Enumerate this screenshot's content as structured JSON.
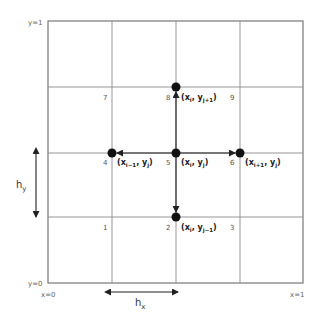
{
  "diagram": {
    "type": "finite-difference 5-point stencil on uniform grid",
    "boundary_labels": {
      "y_top": "y=1",
      "y_bottom": "y=0",
      "x_left": "x=0",
      "x_right": "x=1"
    },
    "spacing_labels": {
      "hy": {
        "base": "h",
        "sub": "y"
      },
      "hx": {
        "base": "h",
        "sub": "x"
      }
    },
    "cell_numbers": [
      "1",
      "2",
      "3",
      "4",
      "5",
      "6",
      "7",
      "8",
      "9"
    ],
    "nodes": [
      {
        "id": "4",
        "x_base": "x",
        "x_sub": "i−1",
        "y_base": "y",
        "y_sub": "j"
      },
      {
        "id": "5",
        "x_base": "x",
        "x_sub": "i",
        "y_base": "y",
        "y_sub": "j"
      },
      {
        "id": "6",
        "x_base": "x",
        "x_sub": "i+1",
        "y_base": "y",
        "y_sub": "j"
      },
      {
        "id": "8",
        "x_base": "x",
        "x_sub": "i",
        "y_base": "y",
        "y_sub": "j+1"
      },
      {
        "id": "2",
        "x_base": "x",
        "x_sub": "i",
        "y_base": "y",
        "y_sub": "j−1"
      }
    ],
    "colors": {
      "grid": "#8a8a8a",
      "border": "#777777",
      "node": "#111111",
      "text": "#222222"
    }
  }
}
